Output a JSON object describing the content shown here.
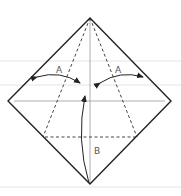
{
  "diagram": {
    "type": "origami-fold-instruction",
    "labels": {
      "fold_left": "A",
      "fold_right": "A",
      "fold_bottom": "B"
    },
    "colors": {
      "outline": "#222222",
      "crease": "#999999",
      "dashed_fold": "#444444",
      "arrow": "#222222",
      "ruled_line": "#e4e4e4",
      "label": "#555555"
    }
  }
}
